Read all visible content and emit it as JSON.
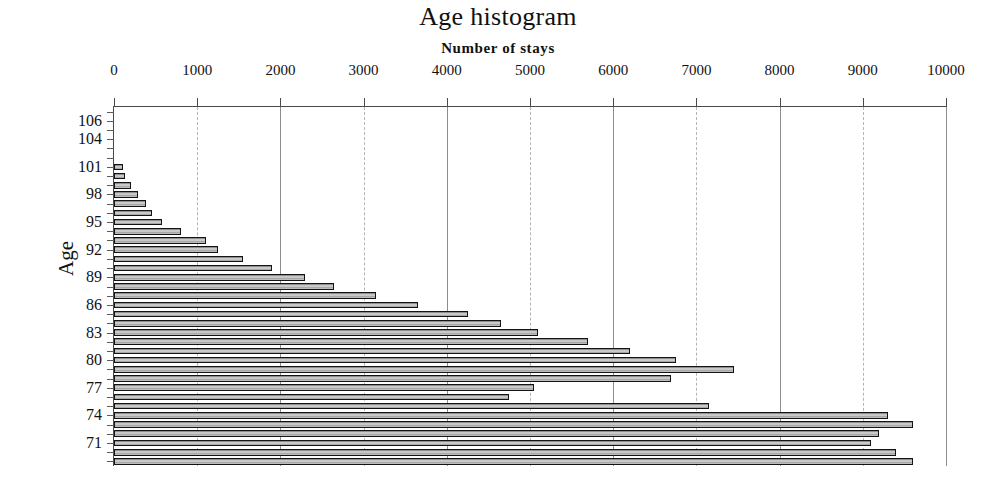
{
  "chart_data": {
    "type": "bar",
    "orientation": "horizontal",
    "title": "Age histogram",
    "subtitle": "Number of stays",
    "xlabel": "Number of stays",
    "ylabel": "Age",
    "xlim": [
      0,
      10000
    ],
    "xticks": [
      0,
      1000,
      2000,
      3000,
      4000,
      5000,
      6000,
      7000,
      8000,
      9000,
      10000
    ],
    "xticklabels": [
      "0",
      "1000",
      "2000",
      "3000",
      "4000",
      "5000",
      "6000",
      "7000",
      "8000",
      "9000",
      "10000"
    ],
    "yticks": [
      106,
      104,
      101,
      98,
      95,
      92,
      89,
      86,
      83,
      80,
      77,
      74,
      71
    ],
    "yticklabels": [
      "106",
      "104",
      "101",
      "98",
      "95",
      "92",
      "89",
      "86",
      "83",
      "80",
      "77",
      "74",
      "71"
    ],
    "grid": true,
    "legend": false,
    "categories": [
      107,
      106,
      105,
      104,
      103,
      102,
      101,
      100,
      99,
      98,
      97,
      96,
      95,
      94,
      93,
      92,
      91,
      90,
      89,
      88,
      87,
      86,
      85,
      84,
      83,
      82,
      81,
      80,
      79,
      78,
      77,
      76,
      75,
      74,
      73,
      72,
      71,
      70,
      69
    ],
    "values": [
      0,
      0,
      0,
      0,
      0,
      0,
      110,
      130,
      200,
      290,
      380,
      460,
      580,
      800,
      1100,
      1250,
      1550,
      1900,
      2300,
      2650,
      3150,
      3650,
      4250,
      4650,
      5100,
      5700,
      6200,
      6750,
      7450,
      6700,
      5050,
      4750,
      7150,
      9300,
      9600,
      9200,
      9100,
      9400,
      9600
    ],
    "units": "stays"
  },
  "axes": {
    "y_axis_title": "Age",
    "x_axis_title": "Number of stays"
  }
}
